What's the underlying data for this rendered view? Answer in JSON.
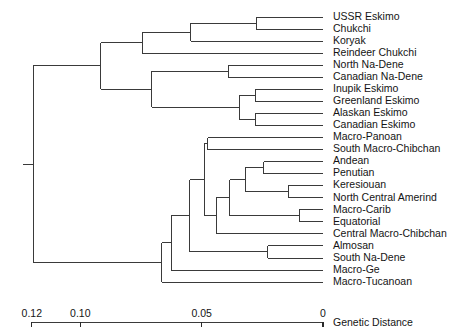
{
  "chart_data": {
    "type": "dendrogram",
    "title": "",
    "xlabel": "Genetic Distance",
    "ylabel": "",
    "xlim": [
      0.13,
      0.0
    ],
    "axis_direction": "reversed",
    "grid": false,
    "legend": "none",
    "tick_values": [
      0.12,
      0.1,
      0.05,
      0
    ],
    "tick_labels": [
      "0.12",
      "0.10",
      "0.05",
      "0"
    ],
    "axis_title": "Genetic  Distance",
    "leaves": [
      {
        "index": 0,
        "label": "USSR  Eskimo",
        "distance": 0.0
      },
      {
        "index": 1,
        "label": "Chukchi",
        "distance": 0.0
      },
      {
        "index": 2,
        "label": "Koryak",
        "distance": 0.0
      },
      {
        "index": 3,
        "label": "Reindeer  Chukchi",
        "distance": 0.0
      },
      {
        "index": 4,
        "label": "North  Na-Dene",
        "distance": 0.0
      },
      {
        "index": 5,
        "label": "Canadian  Na-Dene",
        "distance": 0.0
      },
      {
        "index": 6,
        "label": "Inupik  Eskimo",
        "distance": 0.0
      },
      {
        "index": 7,
        "label": "Greenland  Eskimo",
        "distance": 0.0
      },
      {
        "index": 8,
        "label": "Alaskan  Eskimo",
        "distance": 0.0
      },
      {
        "index": 9,
        "label": "Canadian  Eskimo",
        "distance": 0.0
      },
      {
        "index": 10,
        "label": "Macro-Panoan",
        "distance": 0.0
      },
      {
        "index": 11,
        "label": "South  Macro-Chibchan",
        "distance": 0.0
      },
      {
        "index": 12,
        "label": "Andean",
        "distance": 0.0
      },
      {
        "index": 13,
        "label": "Penutian",
        "distance": 0.0
      },
      {
        "index": 14,
        "label": "Keresiouan",
        "distance": 0.0
      },
      {
        "index": 15,
        "label": "North  Central  Amerind",
        "distance": 0.0
      },
      {
        "index": 16,
        "label": "Macro-Carib",
        "distance": 0.0
      },
      {
        "index": 17,
        "label": "Equatorial",
        "distance": 0.0
      },
      {
        "index": 18,
        "label": "Central  Macro-Chibchan",
        "distance": 0.0
      },
      {
        "index": 19,
        "label": "Almosan",
        "distance": 0.0
      },
      {
        "index": 20,
        "label": "South  Na-Dene",
        "distance": 0.0
      },
      {
        "index": 21,
        "label": "Macro-Ge",
        "distance": 0.0
      },
      {
        "index": 22,
        "label": "Macro-Tucanoan",
        "distance": 0.0
      }
    ],
    "nodes": [
      {
        "id": "n_ussr_chukchi",
        "children": [
          0,
          1
        ],
        "distance": 0.0275
      },
      {
        "id": "n_chukotkan",
        "children": [
          "n_ussr_chukchi",
          2
        ],
        "distance": 0.0545
      },
      {
        "id": "n_chukotkan_reindeer",
        "children": [
          "n_chukotkan",
          3
        ],
        "distance": 0.0745
      },
      {
        "id": "n_nadene",
        "children": [
          4,
          5
        ],
        "distance": 0.039
      },
      {
        "id": "n_inupik_greenland",
        "children": [
          6,
          7
        ],
        "distance": 0.028
      },
      {
        "id": "n_alaskan_canadian",
        "children": [
          8,
          9
        ],
        "distance": 0.028
      },
      {
        "id": "n_eskimo",
        "children": [
          "n_inupik_greenland",
          "n_alaskan_canadian"
        ],
        "distance": 0.0345
      },
      {
        "id": "n_nadene_eskimo",
        "children": [
          "n_nadene",
          "n_eskimo"
        ],
        "distance": 0.0705
      },
      {
        "id": "n_arctic",
        "children": [
          "n_chukotkan_reindeer",
          "n_nadene_eskimo"
        ],
        "distance": 0.0915
      },
      {
        "id": "n_panoan_chibchan",
        "children": [
          10,
          11
        ],
        "distance": 0.0475
      },
      {
        "id": "n_andean_penutian",
        "children": [
          12,
          13
        ],
        "distance": 0.0245
      },
      {
        "id": "n_keres_ncamerind",
        "children": [
          14,
          15
        ],
        "distance": 0.0143
      },
      {
        "id": "n_andean_keres",
        "children": [
          "n_andean_penutian",
          "n_keres_ncamerind"
        ],
        "distance": 0.032
      },
      {
        "id": "n_carib_equatorial",
        "children": [
          16,
          17
        ],
        "distance": 0.0098
      },
      {
        "id": "n_amerind_core",
        "children": [
          "n_andean_keres",
          "n_carib_equatorial"
        ],
        "distance": 0.0385
      },
      {
        "id": "n_amerind_central",
        "children": [
          "n_amerind_core",
          18
        ],
        "distance": 0.044
      },
      {
        "id": "n_amerind_upper",
        "children": [
          "n_panoan_chibchan",
          "n_amerind_central"
        ],
        "distance": 0.049
      },
      {
        "id": "n_almosan_snadene",
        "children": [
          19,
          20
        ],
        "distance": 0.0228
      },
      {
        "id": "n_amerind_mid",
        "children": [
          "n_amerind_upper",
          "n_almosan_snadene"
        ],
        "distance": 0.055
      },
      {
        "id": "n_amerind_ge",
        "children": [
          "n_amerind_mid",
          21
        ],
        "distance": 0.0625
      },
      {
        "id": "n_amerind",
        "children": [
          "n_amerind_ge",
          22
        ],
        "distance": 0.0665
      },
      {
        "id": "n_root",
        "children": [
          "n_arctic",
          "n_amerind"
        ],
        "distance": 0.1195
      }
    ],
    "colors": {
      "branch": "#3a3a3a",
      "text": "#141414",
      "background": "#ffffff"
    }
  }
}
